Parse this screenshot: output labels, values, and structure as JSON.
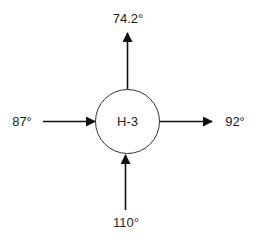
{
  "diagram": {
    "type": "node-flow",
    "node": {
      "label": "H-3",
      "shape": "circle"
    },
    "flows": [
      {
        "direction": "out",
        "side": "top",
        "label": "74.2°"
      },
      {
        "direction": "in",
        "side": "left",
        "label": "87°"
      },
      {
        "direction": "out",
        "side": "right",
        "label": "92°"
      },
      {
        "direction": "in",
        "side": "bottom",
        "label": "110°"
      }
    ],
    "colors": {
      "stroke": "#111111",
      "text": "#222222",
      "background": "#ffffff"
    }
  }
}
